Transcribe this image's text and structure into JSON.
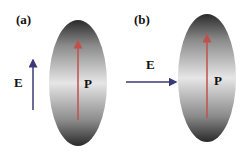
{
  "panels": [
    {
      "label": "(a)",
      "field_label": "E",
      "polarization_label": "P",
      "field_direction": "parallel"
    },
    {
      "label": "(b)",
      "field_label": "E",
      "polarization_label": "P",
      "field_direction": "perpendicular"
    }
  ],
  "colors": {
    "field_arrow": "#3b3a78",
    "polarization_arrow": "#c0504d",
    "ellipsoid_dark": "#2a2a2a",
    "ellipsoid_light": "#e6e6e6"
  }
}
